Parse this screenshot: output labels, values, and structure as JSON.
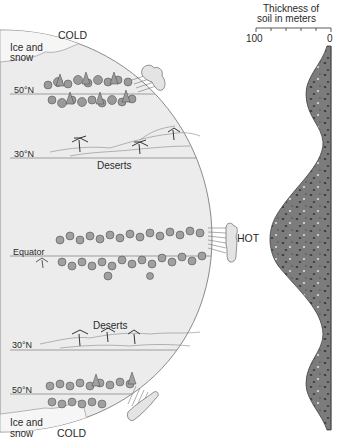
{
  "diagram": {
    "hemisphere": {
      "top_label": "COLD",
      "bottom_label": "COLD",
      "equator_label": "HOT",
      "zones": [
        {
          "id": "ice-north",
          "label_line1": "Ice and",
          "label_line2": "snow"
        },
        {
          "id": "lat-50n-top",
          "label": "50°N"
        },
        {
          "id": "lat-30n-top",
          "label": "30°N"
        },
        {
          "id": "deserts-top",
          "label": "Deserts"
        },
        {
          "id": "equator",
          "label": "Equator"
        },
        {
          "id": "deserts-bottom",
          "label": "Deserts"
        },
        {
          "id": "lat-30n-bottom",
          "label": "30°N"
        },
        {
          "id": "lat-50n-bottom",
          "label": "50°N"
        },
        {
          "id": "ice-south",
          "label_line1": "Ice and",
          "label_line2": "snow"
        }
      ]
    },
    "soil_profile": {
      "title_line1": "Thickness of",
      "title_line2": "soil in meters",
      "axis_min_label": "100",
      "axis_max_label": "0",
      "axis_ticks": 6,
      "fill_color": "#7a7a7a",
      "profile_points": [
        {
          "latitude": "Pole (top)",
          "thickness_m": 2
        },
        {
          "latitude": "50°N",
          "thickness_m": 30
        },
        {
          "latitude": "30°N",
          "thickness_m": 10
        },
        {
          "latitude": "Equator",
          "thickness_m": 85
        },
        {
          "latitude": "30° (bottom)",
          "thickness_m": 10
        },
        {
          "latitude": "50° (bottom)",
          "thickness_m": 30
        },
        {
          "latitude": "Pole (bottom)",
          "thickness_m": 2
        }
      ]
    },
    "colors": {
      "globe_fill": "#ececec",
      "globe_edge": "#8a8a8a",
      "latitude_line": "#8a8a8a",
      "soil_fill": "#7a7a7a",
      "text": "#2a2a2a"
    }
  }
}
